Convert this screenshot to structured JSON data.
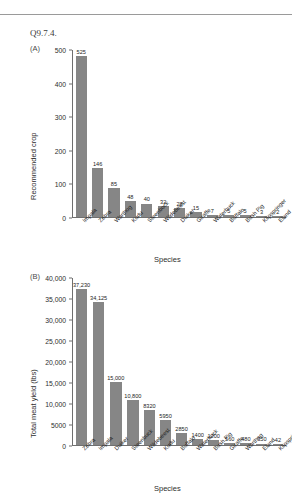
{
  "header": {
    "faded_text": "",
    "question_label": "Q9.7.4."
  },
  "panels": [
    {
      "label": "(A)"
    },
    {
      "label": "(B)"
    }
  ],
  "chart_data": [
    {
      "type": "bar",
      "panel": "(A)",
      "title": "",
      "xlabel": "Species",
      "ylabel": "Recommended crop",
      "ylim": [
        0,
        525
      ],
      "yticks": [
        0,
        100,
        200,
        300,
        400,
        500
      ],
      "ytick_labels": [
        "0",
        "100",
        "200",
        "300",
        "400",
        "500"
      ],
      "grid": false,
      "legend": "none",
      "bar_color": "#868686",
      "categories": [
        "Impala",
        "Zebra",
        "Warthog",
        "Kudu",
        "Steenbock",
        "Wildebeest",
        "Duiker",
        "Giraffe",
        "Waterbuck",
        "Buffalo",
        "Bush Pig",
        "Klipspringer",
        "Eland"
      ],
      "values": [
        525,
        146,
        85,
        48,
        40,
        32,
        28,
        15,
        7,
        5,
        5,
        3,
        2
      ],
      "value_labels": [
        "525",
        "146",
        "85",
        "48",
        "40",
        "32",
        "28",
        "15",
        "7",
        "5",
        "5",
        "3",
        "2"
      ]
    },
    {
      "type": "bar",
      "panel": "(B)",
      "title": "",
      "xlabel": "Species",
      "ylabel": "Total meat yield (lbs)",
      "ylim": [
        0,
        40000
      ],
      "yticks": [
        0,
        5000,
        10000,
        15000,
        20000,
        25000,
        30000,
        35000,
        40000
      ],
      "ytick_labels": [
        "0",
        "5000",
        "10,000",
        "15,000",
        "20,000",
        "25,000",
        "30,000",
        "35,000",
        "40,000"
      ],
      "grid": false,
      "legend": "none",
      "bar_color": "#868686",
      "categories": [
        "Zebra",
        "Impala",
        "Duiker",
        "Steenbuck",
        "Wildebeest",
        "Kudu",
        "Buffalo",
        "Waterbuck",
        "Bush Pig",
        "Giraffe",
        "Warthog",
        "Eland",
        "Klipspringer"
      ],
      "values": [
        37230,
        34125,
        15000,
        10800,
        8320,
        5950,
        2850,
        1400,
        1200,
        560,
        480,
        350,
        42
      ],
      "value_labels": [
        "37,230",
        "34,125",
        "15,000",
        "10,800",
        "8320",
        "5950",
        "2850",
        "1400",
        "1200",
        "560",
        "480",
        "350",
        "42"
      ]
    }
  ]
}
